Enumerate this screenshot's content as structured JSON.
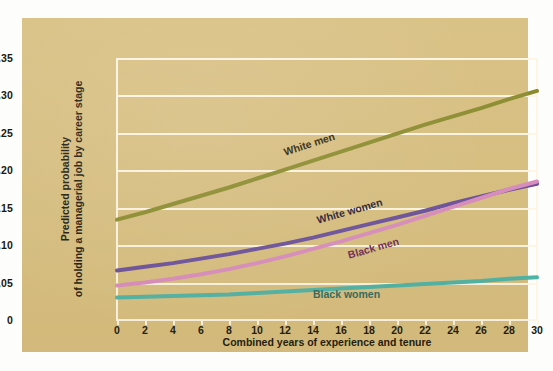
{
  "chart_data": {
    "type": "line",
    "title": "",
    "xlabel": "Combined years of experience and tenure",
    "ylabel_line1": "Predicted probability",
    "ylabel_line2": "of holding a managerial job by career stage",
    "xlim": [
      0,
      30
    ],
    "ylim": [
      0,
      0.35
    ],
    "grid": true,
    "legend_position": "inline-annotations",
    "xticks": [
      0,
      2,
      4,
      6,
      8,
      10,
      12,
      14,
      16,
      18,
      20,
      22,
      24,
      26,
      28,
      30
    ],
    "xtick_labels": [
      "0",
      "2",
      "4",
      "6",
      "8",
      "10",
      "12",
      "14",
      "16",
      "18",
      "20",
      "22",
      "24",
      "26",
      "28",
      "30"
    ],
    "yticks": [
      0,
      0.05,
      0.1,
      0.15,
      0.2,
      0.25,
      0.3,
      0.35
    ],
    "ytick_labels": [
      "0",
      "0.05",
      "0.10",
      "0.15",
      "0.20",
      "0.25",
      "0.30",
      "0.35"
    ],
    "x": [
      0,
      2,
      4,
      6,
      8,
      10,
      12,
      14,
      16,
      18,
      20,
      22,
      24,
      26,
      28,
      30
    ],
    "series": [
      {
        "name": "White men",
        "color": "#8a8b2c",
        "label_x": 262,
        "label_y": 128,
        "label_rotate": -18,
        "label_color": "#2a2208",
        "values": [
          0.134,
          0.144,
          0.155,
          0.166,
          0.177,
          0.189,
          0.201,
          0.213,
          0.225,
          0.237,
          0.249,
          0.261,
          0.272,
          0.283,
          0.295,
          0.306
        ]
      },
      {
        "name": "White women",
        "color": "#6a4f9c",
        "label_x": 295,
        "label_y": 196,
        "label_rotate": -16,
        "label_color": "#241a36",
        "values": [
          0.066,
          0.071,
          0.076,
          0.082,
          0.088,
          0.095,
          0.102,
          0.11,
          0.119,
          0.128,
          0.137,
          0.146,
          0.156,
          0.165,
          0.174,
          0.182
        ]
      },
      {
        "name": "Black men",
        "color": "#d98cbe",
        "label_x": 326,
        "label_y": 231,
        "label_rotate": -16,
        "label_color": "#6d2a54",
        "values": [
          0.046,
          0.05,
          0.055,
          0.061,
          0.068,
          0.076,
          0.085,
          0.095,
          0.105,
          0.116,
          0.127,
          0.139,
          0.151,
          0.163,
          0.175,
          0.185
        ]
      },
      {
        "name": "Black women",
        "color": "#4fb3a6",
        "label_x": 291,
        "label_y": 270,
        "label_rotate": 0,
        "label_color": "#2f6b61",
        "values": [
          0.03,
          0.031,
          0.032,
          0.033,
          0.034,
          0.036,
          0.038,
          0.04,
          0.042,
          0.044,
          0.046,
          0.048,
          0.05,
          0.052,
          0.055,
          0.057
        ]
      }
    ]
  },
  "colors": {
    "panel": "#d8bf80",
    "grid": "#fdf6e4",
    "text": "#20180c"
  }
}
